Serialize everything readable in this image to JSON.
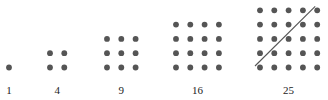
{
  "colors": {
    "dot": "#555555",
    "line": "#555555",
    "text": "#222222"
  },
  "figures": [
    {
      "n": 1,
      "label": "1"
    },
    {
      "n": 2,
      "label": "4"
    },
    {
      "n": 3,
      "label": "9"
    },
    {
      "n": 4,
      "label": "16"
    },
    {
      "n": 5,
      "label": "25",
      "diagonal": true
    }
  ]
}
